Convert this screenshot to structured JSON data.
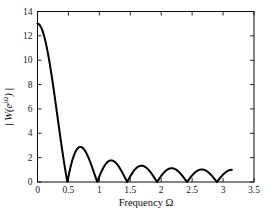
{
  "figure": {
    "background_color": "#ffffff",
    "axis_color": "#0d0d0d",
    "curve_color": "#000000",
    "tick_label_color": "#1a1a1a",
    "xlabel_text": "Frequency Ω",
    "ylabel_prefix": "| W(e",
    "ylabel_sup": "jΩ",
    "ylabel_suffix": ") |"
  },
  "chart_data": {
    "type": "line",
    "title": "",
    "xlabel": "Frequency Ω",
    "ylabel": "|W(e^{jΩ})|",
    "xlim": [
      0,
      3.5
    ],
    "ylim": [
      0,
      14
    ],
    "grid": false,
    "legend": null,
    "box_frame": true,
    "ticks_inward_all_sides": true,
    "xticks": {
      "values": [
        0,
        0.5,
        1,
        1.5,
        2,
        2.5,
        3,
        3.5
      ],
      "labels": [
        "0",
        "0.5",
        "1",
        "1.5",
        "2",
        "2.5",
        "3",
        "3.5"
      ]
    },
    "yticks": {
      "values": [
        0,
        2,
        4,
        6,
        8,
        10,
        12,
        14
      ],
      "labels": [
        "0",
        "2",
        "4",
        "6",
        "8",
        "10",
        "12",
        "14"
      ]
    },
    "series": [
      {
        "name": "|W(e^{jΩ})|",
        "description": "Magnitude of DTFT of a length-13 rectangular window (Dirichlet kernel)",
        "function": {
          "form": "abs(sin(N*x/2)/sin(x/2))",
          "N": 13,
          "x_min": 0,
          "x_max": 3.14159265,
          "samples": 600
        },
        "peak": {
          "x": 0,
          "y": 13
        },
        "zeros": [
          0.483,
          0.967,
          1.45,
          1.933,
          2.417,
          2.9
        ],
        "sidelobe_peaks": [
          {
            "x": 0.72,
            "y": 2.82
          },
          {
            "x": 1.21,
            "y": 1.76
          },
          {
            "x": 1.69,
            "y": 1.34
          },
          {
            "x": 2.17,
            "y": 1.13
          },
          {
            "x": 2.66,
            "y": 1.03
          },
          {
            "x": 3.14,
            "y": 1.0
          }
        ]
      }
    ]
  }
}
